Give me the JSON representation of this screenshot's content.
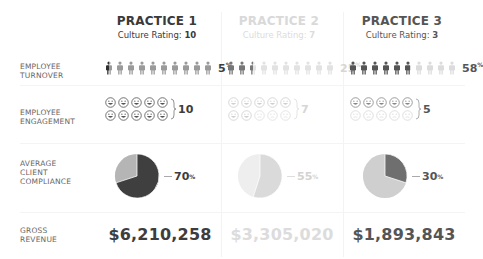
{
  "colors": {
    "dark": "#3d3d3d",
    "mid": "#8c8c8c",
    "light": "#c8c8c8",
    "faint": "#e0e0e0"
  },
  "row_labels": {
    "turnover": [
      "EMPLOYEE",
      "TURNOVER"
    ],
    "engagement": [
      "EMPLOYEE",
      "ENGAGEMENT"
    ],
    "compliance": [
      "AVERAGE",
      "CLIENT",
      "COMPLIANCE"
    ],
    "revenue": [
      "GROSS",
      "REVENUE"
    ]
  },
  "practices": [
    {
      "title": "PRACTICE 1",
      "culture_label": "Culture Rating:",
      "culture_rating": "10",
      "turnover_pct": "5",
      "turnover_suffix": "%",
      "engagement": "10",
      "compliance_pct": "70",
      "compliance_suffix": "%",
      "revenue": "$6,210,258"
    },
    {
      "title": "PRACTICE 2",
      "culture_label": "Culture Rating:",
      "culture_rating": "7",
      "turnover_pct": "25",
      "turnover_suffix": "%",
      "engagement": "7",
      "compliance_pct": "55",
      "compliance_suffix": "%",
      "revenue": "$3,305,020"
    },
    {
      "title": "PRACTICE 3",
      "culture_label": "Culture Rating:",
      "culture_rating": "3",
      "turnover_pct": "58",
      "turnover_suffix": "%",
      "engagement": "5",
      "compliance_pct": "30",
      "compliance_suffix": "%",
      "revenue": "$1,893,843"
    }
  ],
  "chart_data": {
    "type": "table",
    "categories": [
      "PRACTICE 1",
      "PRACTICE 2",
      "PRACTICE 3"
    ],
    "culture_rating": [
      10,
      7,
      3
    ],
    "series": [
      {
        "name": "Employee Turnover (%)",
        "values": [
          5,
          25,
          58
        ],
        "type": "pictograph",
        "icons_total": 10,
        "icons_highlighted": [
          0.5,
          2.5,
          5.8
        ]
      },
      {
        "name": "Employee Engagement",
        "values": [
          10,
          7,
          5
        ],
        "type": "pictograph",
        "icons_total": 10
      },
      {
        "name": "Average Client Compliance (%)",
        "values": [
          70,
          55,
          30
        ],
        "type": "pie"
      },
      {
        "name": "Gross Revenue ($)",
        "values": [
          6210258,
          3305020,
          1893843
        ]
      }
    ]
  }
}
